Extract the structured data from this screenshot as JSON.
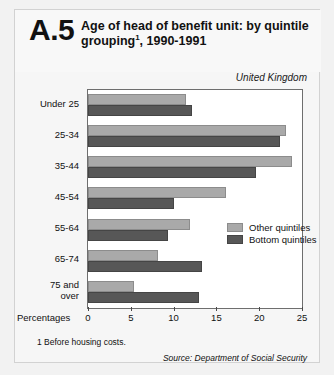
{
  "figure_number": "A.5",
  "title_line1": "Age of head of benefit unit: by quintile",
  "title_line2": "grouping",
  "title_sup": "1",
  "title_line2_rest": ", 1990-1991",
  "subtitle": "United Kingdom",
  "x_axis_label": "Percentages",
  "footnote": "1  Before housing costs.",
  "source": "Source:  Department of Social Security",
  "colors": {
    "other_quintiles": "#a9a9a9",
    "bottom_quintiles": "#575757",
    "plot_border": "#6e6e6e",
    "page_background": "#f6f6f6"
  },
  "chart_data": {
    "type": "bar",
    "orientation": "horizontal",
    "subtitle": "United Kingdom",
    "xlabel": "Percentages",
    "ylabel": "",
    "xlim": [
      0,
      25
    ],
    "xticks": [
      0,
      5,
      10,
      15,
      20,
      25
    ],
    "xticklabels": [
      "0",
      "5",
      "10",
      "15",
      "20",
      "25"
    ],
    "grid": false,
    "legend_position": "right-middle",
    "categories": [
      "Under 25",
      "25-34",
      "35-44",
      "45-54",
      "55-64",
      "65-74",
      "75 and over"
    ],
    "series": [
      {
        "name": "Other quintiles",
        "values": [
          11.4,
          23.1,
          23.8,
          16.1,
          11.9,
          8.2,
          5.4
        ]
      },
      {
        "name": "Bottom quintiles",
        "values": [
          12.2,
          22.4,
          19.6,
          10.0,
          9.3,
          13.3,
          13.0
        ]
      }
    ]
  }
}
